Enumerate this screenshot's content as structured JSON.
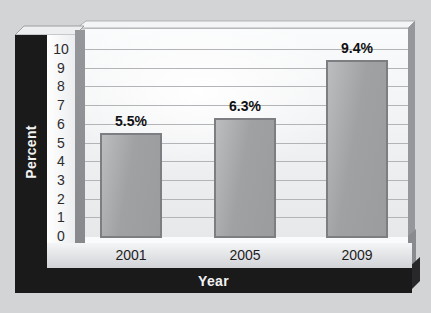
{
  "chart_data": {
    "type": "bar",
    "categories": [
      "2001",
      "2005",
      "2009"
    ],
    "values": [
      5.5,
      6.3,
      9.4
    ],
    "value_labels": [
      "5.5%",
      "6.3%",
      "9.4%"
    ],
    "xlabel": "Year",
    "ylabel": "Percent",
    "ylim": [
      0,
      10
    ],
    "yticks": [
      0,
      1,
      2,
      3,
      4,
      5,
      6,
      7,
      8,
      9,
      10
    ],
    "grid": true,
    "legend_position": "none",
    "bar_color": "#a6a7a9",
    "frame_color": "#1a1a1b",
    "background_color": "#d3d4d6",
    "style": "3d-slab"
  }
}
